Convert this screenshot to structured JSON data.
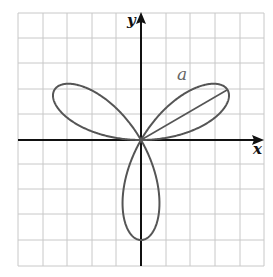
{
  "figure": {
    "axes": {
      "x_label": "x",
      "y_label": "y"
    },
    "segment_label": "a",
    "grid": {
      "cols": 10,
      "rows": 10
    },
    "colors": {
      "grid": "#c8c8c8",
      "axis": "#111111",
      "curve": "#555555",
      "background": "#ffffff"
    }
  },
  "chart_data": {
    "type": "polar-curve",
    "equation": "r = a sin(3θ)",
    "petals": 3,
    "petal_directions_deg": [
      30,
      150,
      270
    ],
    "annotations": [
      {
        "text": "a",
        "meaning": "length of petal from origin to tip"
      }
    ],
    "xlabel": "x",
    "ylabel": "y",
    "grid": true
  }
}
